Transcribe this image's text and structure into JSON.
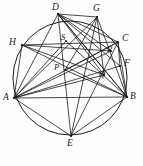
{
  "figure": {
    "type": "geometry-diagram",
    "shape": "circle-with-inscribed-chords",
    "title": "",
    "caption": "",
    "stroke_color": "#1b1b1b",
    "fill_color": "none",
    "background": "#ffffff",
    "circle": {
      "cx": 70,
      "cy": 78,
      "r": 57
    },
    "points": [
      {
        "id": "A",
        "label": "A",
        "x": 14,
        "y": 98,
        "lx": 3,
        "ly": 93,
        "on_circle": true,
        "kind": "vertex"
      },
      {
        "id": "B",
        "label": "B",
        "x": 127,
        "y": 97,
        "lx": 130,
        "ly": 92,
        "on_circle": true,
        "kind": "vertex"
      },
      {
        "id": "C",
        "label": "C",
        "x": 118,
        "y": 42,
        "lx": 122,
        "ly": 34,
        "on_circle": true,
        "kind": "vertex"
      },
      {
        "id": "D",
        "label": "D",
        "x": 58,
        "y": 14,
        "lx": 52,
        "ly": 3,
        "on_circle": true,
        "kind": "vertex"
      },
      {
        "id": "E",
        "label": "E",
        "x": 71,
        "y": 136,
        "lx": 67,
        "ly": 139,
        "on_circle": true,
        "kind": "vertex"
      },
      {
        "id": "F",
        "label": "F",
        "x": 120,
        "y": 66,
        "lx": 124,
        "ly": 59,
        "on_circle": false,
        "kind": "vertex"
      },
      {
        "id": "G",
        "label": "G",
        "x": 97,
        "y": 17,
        "lx": 93,
        "ly": 4,
        "on_circle": false,
        "kind": "vertex"
      },
      {
        "id": "H",
        "label": "H",
        "x": 22,
        "y": 45,
        "lx": 9,
        "ly": 38,
        "on_circle": true,
        "kind": "vertex"
      },
      {
        "id": "P",
        "label": "P",
        "x": 65,
        "y": 70,
        "lx": 54,
        "ly": 63,
        "on_circle": false,
        "kind": "intersection"
      },
      {
        "id": "Q",
        "label": "Q",
        "x": 104,
        "y": 75,
        "lx": 99,
        "ly": 70,
        "on_circle": false,
        "kind": "intersection"
      },
      {
        "id": "R",
        "label": "R",
        "x": 111,
        "y": 51,
        "lx": 107,
        "ly": 45,
        "on_circle": false,
        "kind": "intersection"
      },
      {
        "id": "S",
        "label": "S",
        "x": 66,
        "y": 41,
        "lx": 61,
        "ly": 33,
        "on_circle": false,
        "kind": "intersection"
      }
    ],
    "segments": [
      {
        "from": "A",
        "to": "B"
      },
      {
        "from": "A",
        "to": "C"
      },
      {
        "from": "A",
        "to": "D"
      },
      {
        "from": "A",
        "to": "G"
      },
      {
        "from": "A",
        "to": "H"
      },
      {
        "from": "A",
        "to": "F"
      },
      {
        "from": "A",
        "to": "R"
      },
      {
        "from": "A",
        "to": "Q"
      },
      {
        "from": "A",
        "to": "S"
      },
      {
        "from": "A",
        "to": "E"
      },
      {
        "from": "B",
        "to": "C"
      },
      {
        "from": "B",
        "to": "D"
      },
      {
        "from": "B",
        "to": "G"
      },
      {
        "from": "B",
        "to": "H"
      },
      {
        "from": "B",
        "to": "F"
      },
      {
        "from": "B",
        "to": "S"
      },
      {
        "from": "B",
        "to": "P"
      },
      {
        "from": "B",
        "to": "E"
      },
      {
        "from": "C",
        "to": "D"
      },
      {
        "from": "C",
        "to": "E"
      },
      {
        "from": "C",
        "to": "F"
      },
      {
        "from": "C",
        "to": "H"
      },
      {
        "from": "C",
        "to": "P"
      },
      {
        "from": "D",
        "to": "E"
      },
      {
        "from": "D",
        "to": "F"
      },
      {
        "from": "D",
        "to": "G"
      },
      {
        "from": "D",
        "to": "Q"
      },
      {
        "from": "D",
        "to": "R"
      },
      {
        "from": "D",
        "to": "B"
      },
      {
        "from": "G",
        "to": "Q"
      },
      {
        "from": "G",
        "to": "P"
      },
      {
        "from": "H",
        "to": "Q"
      },
      {
        "from": "H",
        "to": "R"
      },
      {
        "from": "E",
        "to": "G"
      }
    ]
  }
}
